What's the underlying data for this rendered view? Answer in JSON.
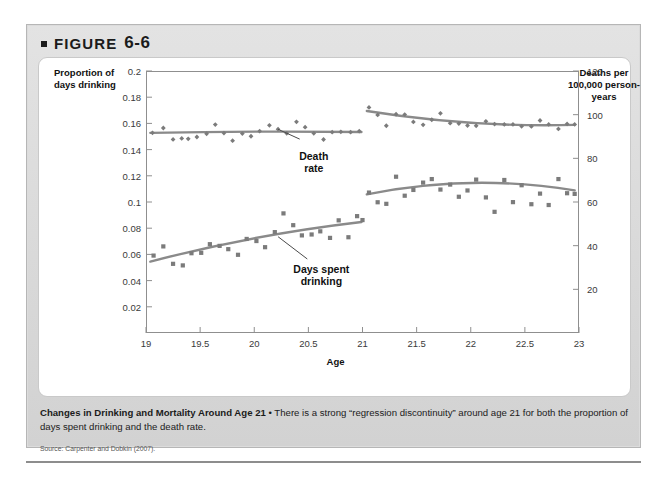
{
  "figure": {
    "bullet": "■",
    "label": "FIGURE",
    "number": "6-6"
  },
  "caption": {
    "title": "Changes in Drinking and Mortality Around Age 21",
    "separator": " • ",
    "body": "There is a strong “regression discontinuity” around age 21 for both the proportion of days spent drinking and the death rate.",
    "source": "Source: Carpenter and Dobkin (2007)."
  },
  "chart_data": {
    "type": "scatter",
    "title": "Changes in Drinking and Mortality Around Age 21",
    "xlabel": "Age",
    "ylabel": "Proportion of days drinking",
    "ylabel_right": "Deaths per 100,000 person-years",
    "xlim": [
      19,
      23
    ],
    "ylim": [
      0,
      0.2
    ],
    "ylim_right": [
      0,
      120
    ],
    "grid": false,
    "legend": "none",
    "xticks": [
      19,
      19.5,
      20,
      20.5,
      21,
      21.5,
      22,
      22.5,
      23
    ],
    "xticklabels": [
      "19",
      "19.5",
      "20",
      "20.5",
      "21",
      "21.5",
      "22",
      "22.5",
      "23"
    ],
    "yticks_left": [
      0.02,
      0.04,
      0.06,
      0.08,
      0.1,
      0.12,
      0.14,
      0.16,
      0.18,
      0.2
    ],
    "yticklabels_left": [
      "0.02",
      "0.04",
      "0.06",
      "0.08",
      "0.1",
      "0.12",
      "0.14",
      "0.16",
      "0.18",
      "0.2"
    ],
    "yticks_right": [
      20,
      40,
      60,
      80,
      100,
      120
    ],
    "yticklabels_right": [
      "20",
      "40",
      "60",
      "80",
      "100",
      "120"
    ],
    "discontinuity_at": 21,
    "marker_color": "#7b7b7b",
    "fit_color": "#8a8a8a",
    "annotations": [
      {
        "text": "Death\nrate",
        "x": 20.55,
        "y": 0.1305,
        "leader_from": [
          20.42,
          0.148
        ],
        "leader_to": [
          20.22,
          0.1555
        ]
      },
      {
        "text": "Days spent\ndrinking",
        "x": 20.62,
        "y": 0.0445,
        "leader_from": [
          20.49,
          0.0565
        ],
        "leader_to": [
          20.22,
          0.0735
        ]
      }
    ],
    "series": [
      {
        "name": "Death rate (left of 21)",
        "axis": "left",
        "marker": "diamond",
        "points": [
          [
            19.06,
            0.1528
          ],
          [
            19.16,
            0.1565
          ],
          [
            19.25,
            0.1478
          ],
          [
            19.33,
            0.1485
          ],
          [
            19.39,
            0.1482
          ],
          [
            19.47,
            0.1496
          ],
          [
            19.56,
            0.1521
          ],
          [
            19.64,
            0.1591
          ],
          [
            19.72,
            0.1526
          ],
          [
            19.8,
            0.1468
          ],
          [
            19.89,
            0.1522
          ],
          [
            19.97,
            0.1502
          ],
          [
            20.05,
            0.1541
          ],
          [
            20.14,
            0.1585
          ],
          [
            20.22,
            0.1556
          ],
          [
            20.3,
            0.1524
          ],
          [
            20.39,
            0.1612
          ],
          [
            20.47,
            0.1571
          ],
          [
            20.55,
            0.1524
          ],
          [
            20.64,
            0.1477
          ],
          [
            20.72,
            0.1533
          ],
          [
            20.8,
            0.1536
          ],
          [
            20.89,
            0.1533
          ],
          [
            20.97,
            0.1541
          ]
        ],
        "fit": [
          [
            19.04,
            0.1528
          ],
          [
            20.02,
            0.1537
          ],
          [
            20.99,
            0.1534
          ]
        ]
      },
      {
        "name": "Death rate (right of 21)",
        "axis": "left",
        "marker": "diamond",
        "points": [
          [
            21.06,
            0.1722
          ],
          [
            21.14,
            0.1665
          ],
          [
            21.22,
            0.1582
          ],
          [
            21.31,
            0.167
          ],
          [
            21.39,
            0.1667
          ],
          [
            21.47,
            0.1611
          ],
          [
            21.56,
            0.1589
          ],
          [
            21.64,
            0.1628
          ],
          [
            21.72,
            0.1677
          ],
          [
            21.81,
            0.1602
          ],
          [
            21.89,
            0.1599
          ],
          [
            21.97,
            0.1584
          ],
          [
            22.05,
            0.1582
          ],
          [
            22.14,
            0.1616
          ],
          [
            22.22,
            0.1595
          ],
          [
            22.31,
            0.1592
          ],
          [
            22.39,
            0.1592
          ],
          [
            22.47,
            0.1578
          ],
          [
            22.56,
            0.1577
          ],
          [
            22.64,
            0.1622
          ],
          [
            22.72,
            0.1592
          ],
          [
            22.81,
            0.1558
          ],
          [
            22.89,
            0.1596
          ],
          [
            22.96,
            0.1592
          ]
        ],
        "fit": [
          [
            21.04,
            0.1695
          ],
          [
            22.0,
            0.1605
          ],
          [
            22.96,
            0.1589
          ]
        ]
      },
      {
        "name": "Days spent drinking (left of 21)",
        "axis": "left",
        "marker": "square",
        "points": [
          [
            19.07,
            0.0591
          ],
          [
            19.16,
            0.0661
          ],
          [
            19.25,
            0.0528
          ],
          [
            19.34,
            0.0516
          ],
          [
            19.42,
            0.0609
          ],
          [
            19.51,
            0.0612
          ],
          [
            19.59,
            0.0678
          ],
          [
            19.68,
            0.0665
          ],
          [
            19.76,
            0.064
          ],
          [
            19.85,
            0.0597
          ],
          [
            19.93,
            0.0718
          ],
          [
            20.02,
            0.0702
          ],
          [
            20.1,
            0.0655
          ],
          [
            20.19,
            0.077
          ],
          [
            20.27,
            0.0913
          ],
          [
            20.36,
            0.0823
          ],
          [
            20.44,
            0.0745
          ],
          [
            20.53,
            0.0752
          ],
          [
            20.61,
            0.0776
          ],
          [
            20.7,
            0.0726
          ],
          [
            20.78,
            0.086
          ],
          [
            20.87,
            0.0731
          ],
          [
            20.95,
            0.0892
          ],
          [
            21.0,
            0.0862
          ]
        ],
        "fit": [
          [
            19.04,
            0.0545
          ],
          [
            20.0,
            0.0723
          ],
          [
            20.99,
            0.0847
          ]
        ]
      },
      {
        "name": "Days spent drinking (right of 21)",
        "axis": "left",
        "marker": "square",
        "points": [
          [
            21.06,
            0.1072
          ],
          [
            21.14,
            0.0998
          ],
          [
            21.22,
            0.0986
          ],
          [
            21.31,
            0.1193
          ],
          [
            21.39,
            0.1048
          ],
          [
            21.47,
            0.1092
          ],
          [
            21.56,
            0.1148
          ],
          [
            21.64,
            0.1175
          ],
          [
            21.72,
            0.1095
          ],
          [
            21.81,
            0.1133
          ],
          [
            21.89,
            0.104
          ],
          [
            21.97,
            0.1088
          ],
          [
            22.05,
            0.1171
          ],
          [
            22.14,
            0.1035
          ],
          [
            22.22,
            0.0925
          ],
          [
            22.31,
            0.1168
          ],
          [
            22.39,
            0.0999
          ],
          [
            22.47,
            0.1128
          ],
          [
            22.56,
            0.0983
          ],
          [
            22.64,
            0.1064
          ],
          [
            22.72,
            0.0977
          ],
          [
            22.81,
            0.1175
          ],
          [
            22.89,
            0.1067
          ],
          [
            22.96,
            0.1062
          ]
        ],
        "fit": [
          [
            21.04,
            0.1058
          ],
          [
            22.0,
            0.1146
          ],
          [
            22.96,
            0.1089
          ]
        ]
      }
    ]
  }
}
